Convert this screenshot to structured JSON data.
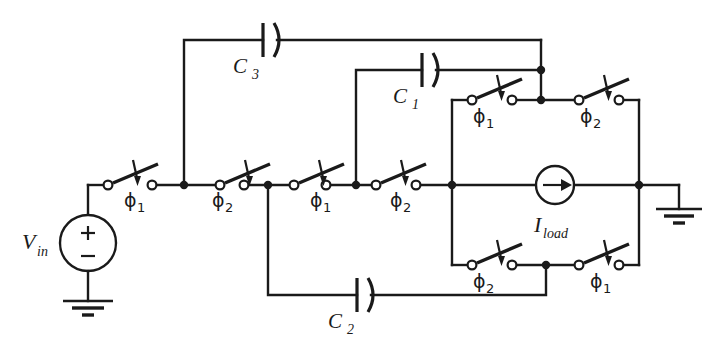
{
  "figure": {
    "kind": "circuit-schematic",
    "background_color": "#ffffff",
    "ink_color": "#1a1a1a",
    "width": 721,
    "height": 345
  },
  "sources": {
    "voltage": {
      "label": "V",
      "subscript": "in",
      "plus": "+",
      "minus": "−",
      "symbol": "voltage-source-circle"
    },
    "current": {
      "label": "I",
      "subscript": "load",
      "symbol": "current-source-circle",
      "arrow_direction": "right"
    }
  },
  "capacitors": [
    {
      "id": "C3",
      "label": "C",
      "subscript": "3",
      "position": "top-rail"
    },
    {
      "id": "C1",
      "label": "C",
      "subscript": "1",
      "position": "upper-rail"
    },
    {
      "id": "C2",
      "label": "C",
      "subscript": "2",
      "position": "bottom-rail"
    }
  ],
  "switches": [
    {
      "id": "sw-main-1",
      "phase": "ϕ",
      "subscript": "1",
      "rail": "main",
      "order": 1
    },
    {
      "id": "sw-main-2",
      "phase": "ϕ",
      "subscript": "2",
      "rail": "main",
      "order": 2
    },
    {
      "id": "sw-main-3",
      "phase": "ϕ",
      "subscript": "1",
      "rail": "main",
      "order": 3
    },
    {
      "id": "sw-main-4",
      "phase": "ϕ",
      "subscript": "2",
      "rail": "main",
      "order": 4
    },
    {
      "id": "sw-top-left",
      "phase": "ϕ",
      "subscript": "1",
      "rail": "top",
      "order": 1
    },
    {
      "id": "sw-top-right",
      "phase": "ϕ",
      "subscript": "2",
      "rail": "top",
      "order": 2
    },
    {
      "id": "sw-bottom-left",
      "phase": "ϕ",
      "subscript": "2",
      "rail": "bottom",
      "order": 1
    },
    {
      "id": "sw-bottom-right",
      "phase": "ϕ",
      "subscript": "1",
      "rail": "bottom",
      "order": 2
    }
  ],
  "grounds": [
    {
      "id": "gnd-left",
      "attached_to": "voltage-source-negative"
    },
    {
      "id": "gnd-right",
      "attached_to": "output-node"
    }
  ]
}
